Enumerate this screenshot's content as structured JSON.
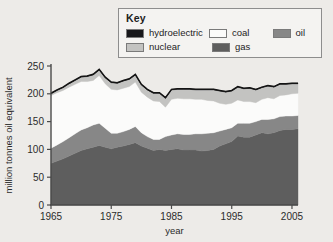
{
  "legend": {
    "title": "Key",
    "items": [
      {
        "label": "hydroelectric",
        "color": "#17171a",
        "swatch": "hydroelectric-swatch"
      },
      {
        "label": "coal",
        "color": "#fbfbfa",
        "swatch": "coal-swatch"
      },
      {
        "label": "oil",
        "color": "#878787",
        "swatch": "oil-swatch"
      },
      {
        "label": "nuclear",
        "color": "#c3c3c1",
        "swatch": "nuclear-swatch"
      },
      {
        "label": "gas",
        "color": "#5e5e5e",
        "swatch": "gas-swatch"
      }
    ]
  },
  "chart_data": {
    "type": "area",
    "stacked": true,
    "title": "",
    "xlabel": "year",
    "ylabel": "million tonnes oil equivalent",
    "xlim": [
      1965,
      2006
    ],
    "ylim": [
      0,
      250
    ],
    "xticks": [
      1965,
      1975,
      1985,
      1995,
      2005
    ],
    "yticks": [
      0,
      50,
      100,
      150,
      200,
      250
    ],
    "grid": false,
    "legend_position": "top-right",
    "x": [
      1965,
      1966,
      1967,
      1968,
      1969,
      1970,
      1971,
      1972,
      1973,
      1974,
      1975,
      1976,
      1977,
      1978,
      1979,
      1980,
      1981,
      1982,
      1983,
      1984,
      1985,
      1986,
      1987,
      1988,
      1989,
      1990,
      1991,
      1992,
      1993,
      1994,
      1995,
      1996,
      1997,
      1998,
      1999,
      2000,
      2001,
      2002,
      2003,
      2004,
      2005,
      2006
    ],
    "series": [
      {
        "name": "gas",
        "color": "#5e5e5e",
        "values": [
          75,
          79,
          83,
          88,
          93,
          98,
          101,
          104,
          107,
          104,
          101,
          104,
          106,
          109,
          112,
          106,
          102,
          98,
          100,
          98,
          100,
          101,
          99,
          99,
          99,
          97,
          98,
          100,
          106,
          110,
          114,
          124,
          122,
          122,
          126,
          130,
          128,
          130,
          134,
          136,
          136,
          137
        ]
      },
      {
        "name": "oil",
        "color": "#878787",
        "values": [
          27,
          29,
          31,
          33,
          35,
          37,
          38,
          40,
          40,
          34,
          28,
          25,
          26,
          27,
          29,
          24,
          21,
          20,
          18,
          25,
          26,
          27,
          28,
          28,
          29,
          31,
          31,
          30,
          27,
          26,
          25,
          23,
          25,
          25,
          24,
          24,
          26,
          25,
          25,
          24,
          24,
          24
        ]
      },
      {
        "name": "coal",
        "color": "#fbfbfa",
        "values": [
          95,
          94,
          92,
          91,
          89,
          87,
          83,
          80,
          86,
          80,
          79,
          78,
          78,
          77,
          80,
          73,
          71,
          69,
          68,
          53,
          64,
          64,
          64,
          64,
          62,
          62,
          59,
          57,
          50,
          45,
          44,
          42,
          39,
          39,
          34,
          36,
          39,
          36,
          38,
          38,
          40,
          40
        ]
      },
      {
        "name": "nuclear",
        "color": "#c3c3c1",
        "values": [
          3,
          4,
          5,
          6,
          7,
          8,
          9,
          10,
          10,
          11,
          12,
          12,
          13,
          13,
          13,
          13,
          13,
          14,
          15,
          16,
          17,
          16,
          17,
          17,
          17,
          17,
          19,
          20,
          22,
          22,
          22,
          23,
          23,
          24,
          23,
          21,
          21,
          21,
          20,
          19,
          18,
          17
        ]
      },
      {
        "name": "hydroelectric",
        "color": "#17171a",
        "values": [
          1,
          1,
          1,
          1,
          1,
          1,
          1,
          1,
          1,
          1,
          1,
          1,
          1,
          1,
          1,
          1,
          1,
          1,
          1,
          1,
          1,
          1,
          1,
          1,
          1,
          1,
          1,
          1,
          1,
          1,
          1,
          1,
          1,
          1,
          1,
          1,
          1,
          1,
          1,
          1,
          1,
          1
        ]
      }
    ],
    "totals": [
      201,
      207,
      212,
      219,
      225,
      231,
      232,
      235,
      244,
      230,
      221,
      220,
      224,
      227,
      235,
      217,
      208,
      202,
      202,
      193,
      208,
      209,
      209,
      209,
      208,
      208,
      208,
      208,
      206,
      204,
      206,
      213,
      210,
      211,
      208,
      212,
      215,
      213,
      218,
      218,
      219,
      219
    ]
  }
}
